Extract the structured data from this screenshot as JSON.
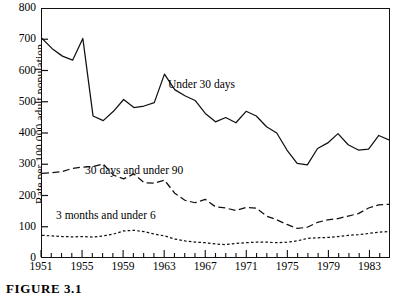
{
  "figure": {
    "caption": "FIGURE 3.1"
  },
  "axes": {
    "y_title": "Rate per 100,000 adult population",
    "y_ticks": [
      0,
      100,
      200,
      300,
      400,
      500,
      600,
      700,
      800
    ],
    "x_ticks_labeled": [
      1951,
      1955,
      1959,
      1963,
      1967,
      1971,
      1975,
      1979,
      1983
    ]
  },
  "series_labels": {
    "under_30_days": "Under 30 days",
    "days30_under90": "30 days and under 90",
    "months3_under6": "3 months and under 6"
  },
  "chart_data": {
    "type": "line",
    "title": "",
    "xlabel": "",
    "ylabel": "Rate per 100,000 adult population",
    "xlim": [
      1951,
      1985
    ],
    "ylim": [
      0,
      800
    ],
    "grid": false,
    "legend": "inline-labels",
    "x": [
      1951,
      1952,
      1953,
      1954,
      1955,
      1956,
      1957,
      1958,
      1959,
      1960,
      1961,
      1962,
      1963,
      1964,
      1965,
      1966,
      1967,
      1968,
      1969,
      1970,
      1971,
      1972,
      1973,
      1974,
      1975,
      1976,
      1977,
      1978,
      1979,
      1980,
      1981,
      1982,
      1983,
      1984,
      1985
    ],
    "series": [
      {
        "name": "Under 30 days",
        "style": "solid",
        "color": "#111111",
        "values": [
          705,
          672,
          648,
          635,
          705,
          455,
          440,
          470,
          508,
          482,
          487,
          498,
          590,
          540,
          520,
          505,
          463,
          436,
          450,
          433,
          470,
          455,
          420,
          400,
          345,
          302,
          297,
          350,
          368,
          398,
          362,
          345,
          348,
          392,
          378
        ]
      },
      {
        "name": "30 days and under 90",
        "style": "long-dash",
        "color": "#111111",
        "values": [
          270,
          272,
          276,
          286,
          290,
          292,
          300,
          264,
          252,
          268,
          240,
          238,
          248,
          206,
          183,
          175,
          186,
          162,
          158,
          150,
          160,
          158,
          132,
          120,
          105,
          92,
          96,
          112,
          120,
          124,
          132,
          140,
          158,
          168,
          170
        ]
      },
      {
        "name": "3 months and under 6",
        "style": "dotted",
        "color": "#111111",
        "values": [
          70,
          68,
          66,
          65,
          66,
          64,
          68,
          74,
          84,
          86,
          82,
          74,
          68,
          58,
          52,
          48,
          46,
          42,
          40,
          44,
          46,
          48,
          48,
          46,
          48,
          52,
          60,
          62,
          63,
          66,
          70,
          72,
          76,
          80,
          82
        ]
      }
    ]
  }
}
